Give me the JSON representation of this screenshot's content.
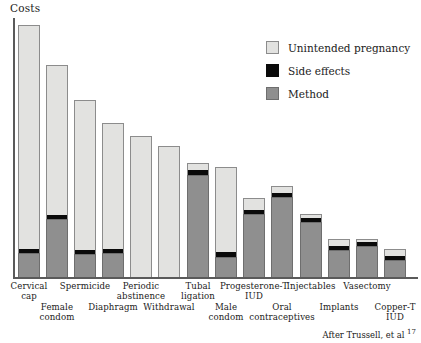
{
  "figure": {
    "y_axis_label": "Costs",
    "attribution_text": "After Trussell, et al",
    "attribution_ref": "17"
  },
  "legend": {
    "position": "top-right",
    "items": [
      {
        "label": "Unintended pregnancy",
        "color": "#e2e2e0",
        "swatch": "legend-swatch-pregnancy"
      },
      {
        "label": "Side effects",
        "color": "#0a0a0a",
        "swatch": "legend-swatch-side-effects"
      },
      {
        "label": "Method",
        "color": "#8f8f8f",
        "swatch": "legend-swatch-method"
      }
    ]
  },
  "chart_data": {
    "type": "bar",
    "subtype": "stacked",
    "title": "",
    "xlabel": "",
    "ylabel": "Costs",
    "grid": false,
    "legend_position": "top-right",
    "axis_note": "y-axis is unlabeled/unitless (relative costs); values below are read as pixel-proportional relative units, baseline 0 at axis",
    "ylim": [
      0,
      259
    ],
    "categories": [
      "Cervical\ncap",
      "Female\ncondom",
      "Spermicide",
      "Diaphragm",
      "Periodic\nabstinence",
      "Withdrawal",
      "Tubal\nligation",
      "Male\ncondom",
      "Progesterone-T\nIUD",
      "Oral\ncontraceptives",
      "Injectables",
      "Implants",
      "Vasectomy",
      "Copper-T\nIUD"
    ],
    "categories_flat": [
      "Cervical cap",
      "Female condom",
      "Spermicide",
      "Diaphragm",
      "Periodic abstinence",
      "Withdrawal",
      "Tubal ligation",
      "Male condom",
      "Progesterone-T IUD",
      "Oral contraceptives",
      "Injectables",
      "Implants",
      "Vasectomy",
      "Copper-T IUD"
    ],
    "series": [
      {
        "name": "Method",
        "color": "#8f8f8f",
        "values": [
          24,
          58,
          23,
          24,
          0,
          0,
          102,
          20,
          63,
          80,
          55,
          27,
          31,
          17
        ]
      },
      {
        "name": "Side effects",
        "color": "#0a0a0a",
        "values": [
          4,
          4,
          4,
          4,
          0,
          0,
          5,
          5,
          4,
          4,
          4,
          4,
          4,
          4
        ]
      },
      {
        "name": "Unintended pregnancy",
        "color": "#e2e2e0",
        "values": [
          224,
          150,
          150,
          126,
          141,
          131,
          7,
          85,
          12,
          7,
          4,
          7,
          3,
          7
        ]
      }
    ],
    "totals": [
      252,
      212,
      177,
      154,
      141,
      131,
      114,
      110,
      79,
      91,
      63,
      38,
      38,
      28
    ]
  },
  "bars": [
    {
      "name": "cervical-cap",
      "label": "Cervical\ncap",
      "x": 5,
      "width": 22,
      "method": 24,
      "side": 4,
      "pregnancy": 224,
      "label_row": "a"
    },
    {
      "name": "female-condom",
      "label": "Female\ncondom",
      "x": 33,
      "width": 22,
      "method": 58,
      "side": 4,
      "pregnancy": 150,
      "label_row": "b"
    },
    {
      "name": "spermicide",
      "label": "Spermicide",
      "x": 61,
      "width": 22,
      "method": 23,
      "side": 4,
      "pregnancy": 150,
      "label_row": "a"
    },
    {
      "name": "diaphragm",
      "label": "Diaphragm",
      "x": 89,
      "width": 22,
      "method": 24,
      "side": 4,
      "pregnancy": 126,
      "label_row": "b"
    },
    {
      "name": "periodic-abstinence",
      "label": "Periodic\nabstinence",
      "x": 117,
      "width": 22,
      "method": 0,
      "side": 0,
      "pregnancy": 141,
      "label_row": "a"
    },
    {
      "name": "withdrawal",
      "label": "Withdrawal",
      "x": 145,
      "width": 22,
      "method": 0,
      "side": 0,
      "pregnancy": 131,
      "label_row": "b"
    },
    {
      "name": "tubal-ligation",
      "label": "Tubal\nligation",
      "x": 174,
      "width": 22,
      "method": 102,
      "side": 5,
      "pregnancy": 7,
      "label_row": "a"
    },
    {
      "name": "male-condom",
      "label": "Male\ncondom",
      "x": 202,
      "width": 22,
      "method": 20,
      "side": 5,
      "pregnancy": 85,
      "label_row": "b"
    },
    {
      "name": "progesterone-t-iud",
      "label": "Progesterone-T\nIUD",
      "x": 230,
      "width": 22,
      "method": 63,
      "side": 4,
      "pregnancy": 12,
      "label_row": "a"
    },
    {
      "name": "oral-contraceptives",
      "label": "Oral\ncontraceptives",
      "x": 258,
      "width": 22,
      "method": 80,
      "side": 4,
      "pregnancy": 7,
      "label_row": "b"
    },
    {
      "name": "injectables",
      "label": "Injectables",
      "x": 287,
      "width": 22,
      "method": 55,
      "side": 4,
      "pregnancy": 4,
      "label_row": "a"
    },
    {
      "name": "implants",
      "label": "Implants",
      "x": 315,
      "width": 22,
      "method": 27,
      "side": 4,
      "pregnancy": 7,
      "label_row": "b"
    },
    {
      "name": "vasectomy",
      "label": "Vasectomy",
      "x": 343,
      "width": 22,
      "method": 31,
      "side": 4,
      "pregnancy": 3,
      "label_row": "a"
    },
    {
      "name": "copper-t-iud",
      "label": "Copper-T\nIUD",
      "x": 371,
      "width": 22,
      "method": 17,
      "side": 4,
      "pregnancy": 7,
      "label_row": "b"
    }
  ]
}
